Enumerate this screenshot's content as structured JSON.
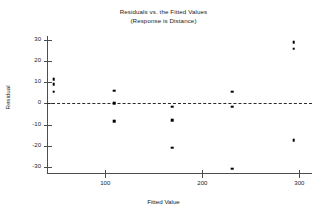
{
  "chart_data": {
    "type": "scatter",
    "title": "Residuals vs. the Fitted Values",
    "subtitle": "(Response is Distance)",
    "xlabel": "Fitted Value",
    "ylabel": "Residual",
    "xlim": [
      40,
      313
    ],
    "ylim": [
      -33,
      32
    ],
    "xticks": [
      100,
      200,
      300
    ],
    "xtick_labels": [
      "100",
      "200",
      "300"
    ],
    "yticks": [
      30,
      20,
      10,
      0,
      -10,
      -20,
      -30
    ],
    "ytick_labels": [
      "30",
      "20",
      "10",
      "0",
      "-10",
      "-20",
      "-30"
    ],
    "grid": false,
    "legend": null,
    "reference_line": {
      "y": 0,
      "style": "dashed"
    },
    "marker": {
      "shape": "square",
      "color": "#000000",
      "size": 2.6
    },
    "points": [
      {
        "x": 47,
        "y": 11.5
      },
      {
        "x": 47,
        "y": 9.0
      },
      {
        "x": 47,
        "y": 5.5
      },
      {
        "x": 109,
        "y": 6.0
      },
      {
        "x": 109,
        "y": 0.0
      },
      {
        "x": 109,
        "y": -8.5
      },
      {
        "x": 169,
        "y": -1.5
      },
      {
        "x": 169,
        "y": -8.0
      },
      {
        "x": 169,
        "y": -21.0
      },
      {
        "x": 231,
        "y": 5.5
      },
      {
        "x": 231,
        "y": -1.5
      },
      {
        "x": 231,
        "y": -31.0
      },
      {
        "x": 294,
        "y": 29.0
      },
      {
        "x": 294,
        "y": 26.0
      },
      {
        "x": 294,
        "y": -17.5
      }
    ]
  }
}
